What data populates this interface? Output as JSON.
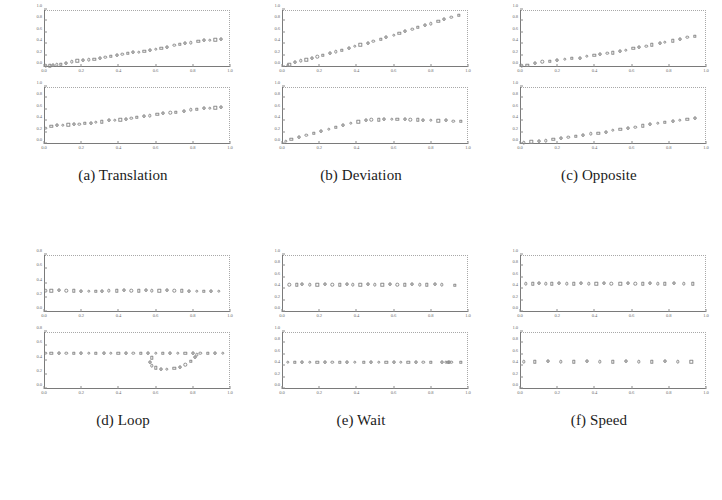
{
  "figure": {
    "width": 722,
    "height": 500,
    "background": "#ffffff",
    "marker_color": "#8d8d8d",
    "axis_color": "#7a7a7a"
  },
  "panels": [
    {
      "id": "panel-a",
      "caption": "(a) Translation",
      "subplots": [
        "a-top",
        "a-bottom"
      ]
    },
    {
      "id": "panel-b",
      "caption": "(b) Deviation",
      "subplots": [
        "b-top",
        "b-bottom"
      ]
    },
    {
      "id": "panel-c",
      "caption": "(c) Opposite",
      "subplots": [
        "c-top",
        "c-bottom"
      ]
    },
    {
      "id": "panel-d",
      "caption": "(d) Loop",
      "subplots": [
        "d-top",
        "d-bottom"
      ]
    },
    {
      "id": "panel-e",
      "caption": "(e) Wait",
      "subplots": [
        "e-top",
        "e-bottom"
      ]
    },
    {
      "id": "panel-f",
      "caption": "(f) Speed",
      "subplots": [
        "f-top",
        "f-bottom"
      ]
    }
  ],
  "chart_data": [
    {
      "id": "a-top",
      "panel": "(a) Translation",
      "type": "scatter",
      "title": "",
      "xlabel": "",
      "ylabel": "",
      "xlim": [
        0.0,
        1.0
      ],
      "ylim": [
        0.0,
        1.0
      ],
      "xticks": [
        0.0,
        0.2,
        0.4,
        0.6,
        0.8,
        1.0
      ],
      "yticks": [
        0.0,
        0.2,
        0.4,
        0.6,
        0.8,
        1.0
      ],
      "xticklabels": [
        "0.0",
        "0.2",
        "0.4",
        "0.6",
        "0.8",
        "1.0"
      ],
      "yticklabels": [
        "0.0",
        "0.2",
        "0.4",
        "0.6",
        "0.8",
        "1.0"
      ],
      "grid": false,
      "legend": null,
      "x": [
        0.01,
        0.03,
        0.05,
        0.07,
        0.09,
        0.12,
        0.15,
        0.18,
        0.21,
        0.24,
        0.27,
        0.3,
        0.33,
        0.36,
        0.39,
        0.42,
        0.45,
        0.48,
        0.51,
        0.54,
        0.57,
        0.6,
        0.63,
        0.66,
        0.7,
        0.73,
        0.76,
        0.79,
        0.83,
        0.86,
        0.89,
        0.92,
        0.95
      ],
      "y": [
        0.02,
        0.02,
        0.03,
        0.04,
        0.05,
        0.07,
        0.09,
        0.11,
        0.12,
        0.13,
        0.14,
        0.16,
        0.17,
        0.19,
        0.2,
        0.22,
        0.24,
        0.25,
        0.26,
        0.28,
        0.3,
        0.31,
        0.33,
        0.35,
        0.38,
        0.4,
        0.42,
        0.43,
        0.45,
        0.46,
        0.47,
        0.48,
        0.49
      ]
    },
    {
      "id": "a-bottom",
      "panel": "(a) Translation",
      "type": "scatter",
      "title": "",
      "xlabel": "",
      "ylabel": "",
      "xlim": [
        0.0,
        1.0
      ],
      "ylim": [
        0.0,
        1.0
      ],
      "xticks": [
        0.0,
        0.2,
        0.4,
        0.6,
        0.8,
        1.0
      ],
      "yticks": [
        0.0,
        0.2,
        0.4,
        0.6,
        0.8,
        1.0
      ],
      "xticklabels": [
        "0.0",
        "0.2",
        "0.4",
        "0.6",
        "0.8",
        "1.0"
      ],
      "yticklabels": [
        "0.0",
        "0.2",
        "0.4",
        "0.6",
        "0.8",
        "1.0"
      ],
      "grid": false,
      "legend": null,
      "x": [
        0.01,
        0.04,
        0.07,
        0.1,
        0.13,
        0.16,
        0.19,
        0.22,
        0.25,
        0.28,
        0.31,
        0.35,
        0.38,
        0.41,
        0.44,
        0.47,
        0.5,
        0.54,
        0.57,
        0.61,
        0.64,
        0.68,
        0.71,
        0.75,
        0.79,
        0.82,
        0.86,
        0.89,
        0.92,
        0.95
      ],
      "y": [
        0.28,
        0.31,
        0.32,
        0.33,
        0.34,
        0.34,
        0.35,
        0.36,
        0.37,
        0.38,
        0.39,
        0.41,
        0.42,
        0.43,
        0.44,
        0.45,
        0.47,
        0.49,
        0.5,
        0.52,
        0.53,
        0.55,
        0.56,
        0.58,
        0.6,
        0.61,
        0.62,
        0.63,
        0.64,
        0.65
      ]
    },
    {
      "id": "b-top",
      "panel": "(b) Deviation",
      "type": "scatter",
      "title": "",
      "xlabel": "",
      "ylabel": "",
      "xlim": [
        0.0,
        1.0
      ],
      "ylim": [
        0.0,
        1.0
      ],
      "xticks": [
        0.0,
        0.2,
        0.4,
        0.6,
        0.8,
        1.0
      ],
      "yticks": [
        0.0,
        0.2,
        0.4,
        0.6,
        0.8,
        1.0
      ],
      "xticklabels": [
        "0.0",
        "0.2",
        "0.4",
        "0.6",
        "0.8",
        "1.0"
      ],
      "yticklabels": [
        "0.0",
        "0.2",
        "0.4",
        "0.6",
        "0.8",
        "1.0"
      ],
      "grid": false,
      "legend": null,
      "x": [
        0.03,
        0.04,
        0.07,
        0.1,
        0.13,
        0.16,
        0.19,
        0.22,
        0.26,
        0.29,
        0.32,
        0.36,
        0.39,
        0.42,
        0.46,
        0.49,
        0.53,
        0.56,
        0.6,
        0.63,
        0.66,
        0.7,
        0.73,
        0.77,
        0.8,
        0.84,
        0.87,
        0.91,
        0.95
      ],
      "y": [
        0.03,
        0.04,
        0.08,
        0.11,
        0.13,
        0.15,
        0.18,
        0.21,
        0.24,
        0.27,
        0.3,
        0.33,
        0.36,
        0.39,
        0.42,
        0.45,
        0.49,
        0.52,
        0.56,
        0.59,
        0.62,
        0.66,
        0.7,
        0.73,
        0.76,
        0.8,
        0.84,
        0.87,
        0.91
      ]
    },
    {
      "id": "b-bottom",
      "panel": "(b) Deviation",
      "type": "scatter",
      "title": "",
      "xlabel": "",
      "ylabel": "",
      "xlim": [
        0.0,
        1.0
      ],
      "ylim": [
        0.0,
        1.0
      ],
      "xticks": [
        0.0,
        0.2,
        0.4,
        0.6,
        0.8,
        1.0
      ],
      "yticks": [
        0.0,
        0.2,
        0.4,
        0.6,
        0.8,
        1.0
      ],
      "xticklabels": [
        "0.0",
        "0.2",
        "0.4",
        "0.6",
        "0.8",
        "1.0"
      ],
      "yticklabels": [
        "0.0",
        "0.2",
        "0.4",
        "0.6",
        "0.8",
        "1.0"
      ],
      "grid": false,
      "legend": null,
      "x": [
        0.02,
        0.05,
        0.09,
        0.13,
        0.17,
        0.21,
        0.25,
        0.29,
        0.33,
        0.37,
        0.41,
        0.45,
        0.48,
        0.52,
        0.55,
        0.59,
        0.62,
        0.66,
        0.69,
        0.73,
        0.76,
        0.8,
        0.84,
        0.88,
        0.92,
        0.96
      ],
      "y": [
        0.05,
        0.08,
        0.12,
        0.16,
        0.19,
        0.22,
        0.26,
        0.29,
        0.32,
        0.36,
        0.39,
        0.42,
        0.43,
        0.43,
        0.44,
        0.44,
        0.44,
        0.44,
        0.43,
        0.43,
        0.42,
        0.42,
        0.41,
        0.41,
        0.4,
        0.4
      ]
    },
    {
      "id": "c-top",
      "panel": "(c) Opposite",
      "type": "scatter",
      "title": "",
      "xlabel": "",
      "ylabel": "",
      "xlim": [
        0.0,
        1.0
      ],
      "ylim": [
        0.0,
        1.0
      ],
      "xticks": [
        0.0,
        0.2,
        0.4,
        0.6,
        0.8,
        1.0
      ],
      "yticks": [
        0.0,
        0.2,
        0.4,
        0.6,
        0.8,
        1.0
      ],
      "xticklabels": [
        "0.0",
        "0.2",
        "0.4",
        "0.6",
        "0.8",
        "1.0"
      ],
      "yticklabels": [
        "0.0",
        "0.2",
        "0.4",
        "0.6",
        "0.8",
        "1.0"
      ],
      "grid": false,
      "legend": null,
      "x": [
        0.01,
        0.04,
        0.08,
        0.12,
        0.16,
        0.2,
        0.24,
        0.28,
        0.32,
        0.36,
        0.4,
        0.43,
        0.47,
        0.5,
        0.54,
        0.57,
        0.61,
        0.64,
        0.68,
        0.71,
        0.75,
        0.78,
        0.82,
        0.86,
        0.9,
        0.94
      ],
      "y": [
        0.02,
        0.03,
        0.07,
        0.09,
        0.1,
        0.12,
        0.14,
        0.15,
        0.16,
        0.19,
        0.21,
        0.22,
        0.24,
        0.25,
        0.28,
        0.3,
        0.33,
        0.35,
        0.37,
        0.39,
        0.42,
        0.44,
        0.46,
        0.49,
        0.52,
        0.54
      ]
    },
    {
      "id": "c-bottom",
      "panel": "(c) Opposite",
      "type": "scatter",
      "title": "",
      "xlabel": "",
      "ylabel": "",
      "xlim": [
        0.0,
        1.0
      ],
      "ylim": [
        0.0,
        1.0
      ],
      "xticks": [
        0.0,
        0.2,
        0.4,
        0.6,
        0.8,
        1.0
      ],
      "yticks": [
        0.0,
        0.2,
        0.4,
        0.6,
        0.8,
        1.0
      ],
      "xticklabels": [
        "0.0",
        "0.2",
        "0.4",
        "0.6",
        "0.8",
        "1.0"
      ],
      "yticklabels": [
        "0.0",
        "0.2",
        "0.4",
        "0.6",
        "0.8",
        "1.0"
      ],
      "grid": false,
      "legend": null,
      "x": [
        0.02,
        0.06,
        0.1,
        0.14,
        0.18,
        0.22,
        0.26,
        0.3,
        0.34,
        0.38,
        0.42,
        0.46,
        0.5,
        0.54,
        0.58,
        0.62,
        0.66,
        0.7,
        0.74,
        0.78,
        0.82,
        0.86,
        0.9,
        0.94
      ],
      "y": [
        0.02,
        0.04,
        0.05,
        0.06,
        0.08,
        0.1,
        0.12,
        0.14,
        0.16,
        0.18,
        0.19,
        0.21,
        0.24,
        0.26,
        0.28,
        0.3,
        0.32,
        0.34,
        0.36,
        0.38,
        0.4,
        0.42,
        0.44,
        0.45
      ]
    },
    {
      "id": "d-top",
      "panel": "(d) Loop",
      "type": "scatter",
      "title": "",
      "xlabel": "",
      "ylabel": "",
      "xlim": [
        0.0,
        1.0
      ],
      "ylim": [
        0.0,
        0.8
      ],
      "xticks": [
        0.0,
        0.2,
        0.4,
        0.6,
        0.8,
        1.0
      ],
      "yticks": [
        0.0,
        0.2,
        0.4,
        0.6,
        0.8
      ],
      "xticklabels": [
        "0.0",
        "0.2",
        "0.4",
        "0.6",
        "0.8",
        "1.0"
      ],
      "yticklabels": [
        "0.0",
        "0.2",
        "0.4",
        "0.6",
        "0.8"
      ],
      "grid": false,
      "legend": null,
      "x": [
        0.01,
        0.04,
        0.08,
        0.12,
        0.16,
        0.2,
        0.24,
        0.28,
        0.31,
        0.35,
        0.39,
        0.43,
        0.47,
        0.51,
        0.55,
        0.58,
        0.62,
        0.66,
        0.7,
        0.74,
        0.78,
        0.82,
        0.86,
        0.9,
        0.94
      ],
      "y": [
        0.3,
        0.3,
        0.3,
        0.3,
        0.3,
        0.29,
        0.29,
        0.29,
        0.29,
        0.3,
        0.3,
        0.3,
        0.3,
        0.3,
        0.3,
        0.3,
        0.3,
        0.3,
        0.3,
        0.3,
        0.29,
        0.29,
        0.29,
        0.29,
        0.29
      ]
    },
    {
      "id": "d-bottom",
      "panel": "(d) Loop",
      "type": "scatter",
      "title": "",
      "xlabel": "",
      "ylabel": "",
      "xlim": [
        0.0,
        1.0
      ],
      "ylim": [
        0.0,
        0.8
      ],
      "xticks": [
        0.0,
        0.2,
        0.4,
        0.6,
        0.8,
        1.0
      ],
      "yticks": [
        0.0,
        0.2,
        0.4,
        0.6,
        0.8
      ],
      "xticklabels": [
        "0.0",
        "0.2",
        "0.4",
        "0.6",
        "0.8",
        "1.0"
      ],
      "yticklabels": [
        "0.0",
        "0.2",
        "0.4",
        "0.6",
        "0.8"
      ],
      "grid": false,
      "legend": null,
      "note": "flat track with a loop excursion dipping below the baseline between x=0.55 and x=0.85",
      "x": [
        0.01,
        0.04,
        0.08,
        0.12,
        0.16,
        0.2,
        0.24,
        0.28,
        0.32,
        0.36,
        0.4,
        0.44,
        0.48,
        0.52,
        0.56,
        0.6,
        0.64,
        0.68,
        0.72,
        0.76,
        0.8,
        0.84,
        0.88,
        0.92,
        0.96,
        0.58,
        0.57,
        0.58,
        0.6,
        0.63,
        0.66,
        0.7,
        0.73,
        0.76,
        0.79,
        0.81,
        0.82
      ],
      "y": [
        0.5,
        0.5,
        0.5,
        0.5,
        0.5,
        0.5,
        0.5,
        0.5,
        0.5,
        0.5,
        0.5,
        0.5,
        0.5,
        0.5,
        0.5,
        0.5,
        0.5,
        0.5,
        0.5,
        0.5,
        0.5,
        0.5,
        0.5,
        0.5,
        0.5,
        0.44,
        0.38,
        0.33,
        0.3,
        0.28,
        0.28,
        0.29,
        0.31,
        0.34,
        0.39,
        0.44,
        0.48
      ]
    },
    {
      "id": "e-top",
      "panel": "(e) Wait",
      "type": "scatter",
      "title": "",
      "xlabel": "",
      "ylabel": "",
      "xlim": [
        0.0,
        1.0
      ],
      "ylim": [
        0.0,
        1.0
      ],
      "xticks": [
        0.0,
        0.2,
        0.4,
        0.6,
        0.8,
        1.0
      ],
      "yticks": [
        0.0,
        0.2,
        0.4,
        0.6,
        0.8,
        1.0
      ],
      "xticklabels": [
        "0.0",
        "0.2",
        "0.4",
        "0.6",
        "0.8",
        "1.0"
      ],
      "yticklabels": [
        "0.0",
        "0.2",
        "0.4",
        "0.6",
        "0.8",
        "1.0"
      ],
      "grid": false,
      "legend": null,
      "x": [
        0.04,
        0.08,
        0.11,
        0.15,
        0.19,
        0.23,
        0.27,
        0.31,
        0.35,
        0.38,
        0.42,
        0.46,
        0.5,
        0.54,
        0.58,
        0.62,
        0.66,
        0.7,
        0.74,
        0.78,
        0.82,
        0.86,
        0.93
      ],
      "y": [
        0.48,
        0.48,
        0.48,
        0.48,
        0.48,
        0.48,
        0.48,
        0.48,
        0.48,
        0.48,
        0.48,
        0.48,
        0.48,
        0.48,
        0.48,
        0.48,
        0.48,
        0.48,
        0.48,
        0.48,
        0.48,
        0.48,
        0.47
      ]
    },
    {
      "id": "e-bottom",
      "panel": "(e) Wait",
      "type": "scatter",
      "title": "",
      "xlabel": "",
      "ylabel": "",
      "xlim": [
        0.0,
        1.0
      ],
      "ylim": [
        0.0,
        1.0
      ],
      "xticks": [
        0.0,
        0.2,
        0.4,
        0.6,
        0.8,
        1.0
      ],
      "yticks": [
        0.0,
        0.2,
        0.4,
        0.6,
        0.8,
        1.0
      ],
      "xticklabels": [
        "0.0",
        "0.2",
        "0.4",
        "0.6",
        "0.8",
        "1.0"
      ],
      "yticklabels": [
        "0.0",
        "0.2",
        "0.4",
        "0.6",
        "0.8",
        "1.0"
      ],
      "grid": false,
      "legend": null,
      "note": "markers bunch into a dense overlapping cluster near x=0.90 where the agent waits",
      "x": [
        0.03,
        0.07,
        0.11,
        0.15,
        0.19,
        0.23,
        0.27,
        0.31,
        0.35,
        0.39,
        0.44,
        0.48,
        0.52,
        0.56,
        0.6,
        0.64,
        0.68,
        0.72,
        0.76,
        0.8,
        0.86,
        0.88,
        0.89,
        0.9,
        0.91,
        0.96
      ],
      "y": [
        0.47,
        0.47,
        0.47,
        0.47,
        0.47,
        0.47,
        0.47,
        0.47,
        0.47,
        0.47,
        0.47,
        0.47,
        0.47,
        0.47,
        0.47,
        0.47,
        0.47,
        0.47,
        0.47,
        0.47,
        0.47,
        0.47,
        0.47,
        0.47,
        0.47,
        0.47
      ]
    },
    {
      "id": "f-top",
      "panel": "(f) Speed",
      "type": "scatter",
      "title": "",
      "xlabel": "",
      "ylabel": "",
      "xlim": [
        0.0,
        1.0
      ],
      "ylim": [
        0.0,
        1.0
      ],
      "xticks": [
        0.0,
        0.2,
        0.4,
        0.6,
        0.8,
        1.0
      ],
      "yticks": [
        0.0,
        0.2,
        0.4,
        0.6,
        0.8,
        1.0
      ],
      "xticklabels": [
        "0.0",
        "0.2",
        "0.4",
        "0.6",
        "0.8",
        "1.0"
      ],
      "yticklabels": [
        "0.0",
        "0.2",
        "0.4",
        "0.6",
        "0.8",
        "1.0"
      ],
      "grid": false,
      "legend": null,
      "x": [
        0.03,
        0.07,
        0.1,
        0.14,
        0.17,
        0.21,
        0.25,
        0.29,
        0.33,
        0.37,
        0.41,
        0.45,
        0.49,
        0.54,
        0.58,
        0.62,
        0.66,
        0.7,
        0.74,
        0.78,
        0.83,
        0.88,
        0.93
      ],
      "y": [
        0.5,
        0.5,
        0.5,
        0.5,
        0.5,
        0.5,
        0.5,
        0.5,
        0.5,
        0.5,
        0.5,
        0.5,
        0.5,
        0.5,
        0.5,
        0.5,
        0.5,
        0.5,
        0.5,
        0.5,
        0.5,
        0.5,
        0.5
      ]
    },
    {
      "id": "f-bottom",
      "panel": "(f) Speed",
      "type": "scatter",
      "title": "",
      "xlabel": "",
      "ylabel": "",
      "xlim": [
        0.0,
        1.0
      ],
      "ylim": [
        0.0,
        1.0
      ],
      "xticks": [
        0.0,
        0.2,
        0.4,
        0.6,
        0.8,
        1.0
      ],
      "yticks": [
        0.0,
        0.2,
        0.4,
        0.6,
        0.8,
        1.0
      ],
      "xticklabels": [
        "0.0",
        "0.2",
        "0.4",
        "0.6",
        "0.8",
        "1.0"
      ],
      "yticklabels": [
        "0.0",
        "0.2",
        "0.4",
        "0.6",
        "0.8",
        "1.0"
      ],
      "grid": false,
      "legend": null,
      "note": "fewer, more widely spaced samples than the top subplot, indicating faster motion",
      "x": [
        0.02,
        0.08,
        0.15,
        0.22,
        0.29,
        0.36,
        0.43,
        0.5,
        0.57,
        0.64,
        0.71,
        0.78,
        0.85,
        0.92
      ],
      "y": [
        0.48,
        0.48,
        0.48,
        0.48,
        0.48,
        0.48,
        0.48,
        0.48,
        0.48,
        0.48,
        0.48,
        0.48,
        0.48,
        0.48
      ]
    }
  ]
}
